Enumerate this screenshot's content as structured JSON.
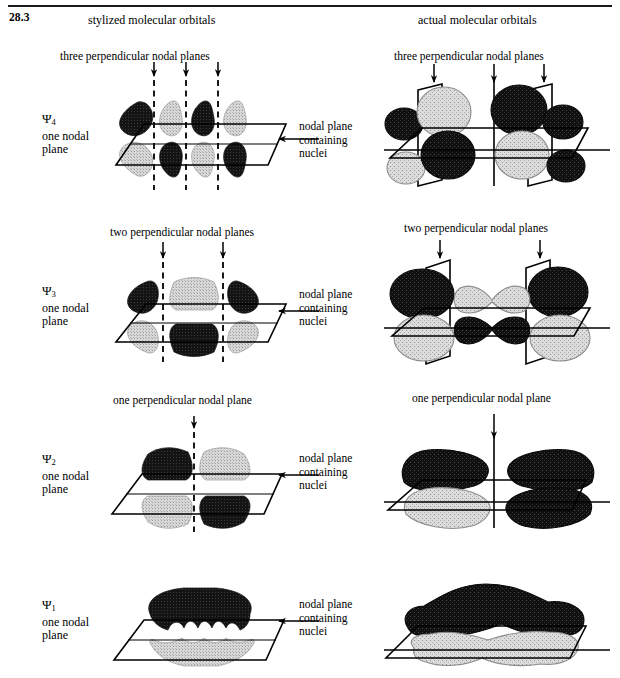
{
  "figure": {
    "number": "28.3",
    "columns": {
      "left_header": "stylized molecular orbitals",
      "right_header": "actual molecular orbitals"
    },
    "nodal_plane_note": {
      "line1": "nodal plane",
      "line2": "containing",
      "line3": "nuclei"
    }
  },
  "rows": [
    {
      "psi": "Ψ",
      "subscript": "4",
      "label_line2": "one nodal",
      "label_line3": "plane",
      "perpendicular_caption": "three perpendicular nodal planes",
      "perpendicular_count": 3,
      "lobe_signs_top": [
        "dark",
        "light",
        "dark",
        "light"
      ],
      "note_left": "nodal plane",
      "note_mid": "containing",
      "note_right": "nuclei"
    },
    {
      "psi": "Ψ",
      "subscript": "3",
      "label_line2": "one nodal",
      "label_line3": "plane",
      "perpendicular_caption": "two perpendicular nodal planes",
      "perpendicular_count": 2,
      "lobe_signs_top": [
        "dark",
        "light",
        "light",
        "dark"
      ],
      "note_left": "nodal plane",
      "note_mid": "containing",
      "note_right": "nuclei"
    },
    {
      "psi": "Ψ",
      "subscript": "2",
      "label_line2": "one nodal",
      "label_line3": "plane",
      "perpendicular_caption": "one perpendicular nodal plane",
      "perpendicular_count": 1,
      "lobe_signs_top": [
        "dark",
        "dark",
        "light",
        "light"
      ],
      "note_left": "nodal plane",
      "note_mid": "containing",
      "note_right": "nuclei"
    },
    {
      "psi": "Ψ",
      "subscript": "1",
      "label_line2": "one nodal",
      "label_line3": "plane",
      "perpendicular_caption": "",
      "perpendicular_count": 0,
      "lobe_signs_top": [
        "dark",
        "dark",
        "dark",
        "dark"
      ],
      "note_left": "nodal plane",
      "note_mid": "containing",
      "note_right": "nuclei"
    }
  ],
  "colors": {
    "dark_lobe": "#111111",
    "light_lobe": "#cfcfcf",
    "line": "#000000",
    "background": "#ffffff"
  }
}
